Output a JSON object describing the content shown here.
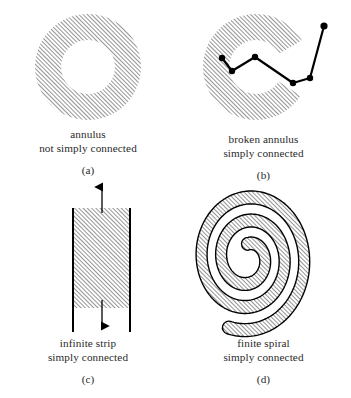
{
  "figure": {
    "panels": [
      {
        "key": "(a)",
        "name": "annulus",
        "caption_line1": "annulus",
        "caption_line2": "not simply connected",
        "shape": "annulus",
        "geometry": {
          "center_x": 88,
          "center_y": 67,
          "outer_radius": 53,
          "inner_radius": 27
        }
      },
      {
        "key": "(b)",
        "name": "broken-annulus",
        "caption_line1": "broken annulus",
        "caption_line2": "simply connected",
        "shape": "broken-annulus",
        "geometry": {
          "center_x": 80,
          "center_y": 67,
          "outer_radius": 53,
          "inner_radius": 27,
          "gap_start_degrees": -32,
          "gap_end_degrees": 27
        },
        "polyline": {
          "points": [
            [
              46,
              58
            ],
            [
              56,
              71
            ],
            [
              79,
              57
            ],
            [
              117,
              83
            ],
            [
              134,
              78
            ],
            [
              148,
              26
            ]
          ],
          "dot_radius": 3.2,
          "stroke_width": 2.2,
          "color": "#000000"
        }
      },
      {
        "key": "(c)",
        "name": "infinite-strip",
        "caption_line1": "infinite strip",
        "caption_line2": "simply connected",
        "shape": "strip",
        "geometry": {
          "left_x": 23,
          "right_x": 80,
          "hatch_top_y": 28,
          "hatch_bottom_y": 128,
          "border_top_y": 28,
          "border_bottom_y": 152,
          "arrow_up_top_y": 5,
          "arrow_down_bottom_y": 148,
          "arrow_x": 52
        }
      },
      {
        "key": "(d)",
        "name": "finite-spiral",
        "caption_line1": "finite spiral",
        "caption_line2": "simply connected",
        "shape": "spiral",
        "geometry": {
          "center_x": 72,
          "center_y": 78,
          "turns": 2.55,
          "band_width": 11,
          "start_radius": 12,
          "end_radius": 62
        }
      }
    ],
    "style": {
      "hatch_angle_degrees": 45,
      "hatch_spacing": 3,
      "hatch_color": "#3c3c3c",
      "outline_color": "#000000",
      "background": "#ffffff"
    }
  }
}
